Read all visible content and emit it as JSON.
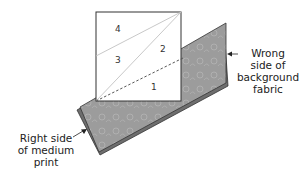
{
  "diagram": {
    "type": "quilting-instruction",
    "square": {
      "sections": [
        {
          "id": "4",
          "label": "4"
        },
        {
          "id": "3",
          "label": "3"
        },
        {
          "id": "2",
          "label": "2"
        },
        {
          "id": "1",
          "label": "1"
        }
      ]
    },
    "labels": {
      "right": {
        "lines": [
          "Wrong",
          "side of",
          "background",
          "fabric"
        ]
      },
      "left": {
        "lines": [
          "Right side",
          "of medium",
          "print"
        ]
      }
    },
    "colors": {
      "fabric": "#9c9c9c",
      "fabric_back": "#6e6e6e",
      "square_fill": "#ffffff",
      "outline": "#333333",
      "guide_line": "#bdbdbd",
      "dashed_line": "#555555"
    }
  }
}
